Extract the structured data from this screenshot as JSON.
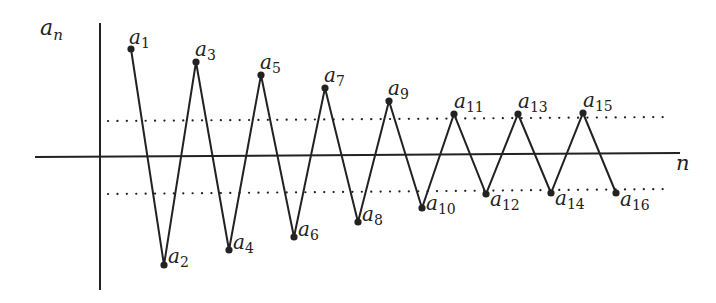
{
  "diagram": {
    "title": "",
    "y_axis_label": {
      "base": "a",
      "sub": "n"
    },
    "x_axis_label": "n",
    "colors": {
      "line": "#222222",
      "background": "#ffffff"
    },
    "axes": {
      "vertical": {
        "x": 100,
        "y1": 23,
        "y2": 290
      },
      "horizontal": {
        "x1": 35,
        "y1": 157,
        "x2": 680,
        "y2": 153
      }
    },
    "bounds": [
      {
        "name": "upper-bound",
        "style": "dotted",
        "x1": 108,
        "y1": 121,
        "x2": 668,
        "y2": 117
      },
      {
        "name": "lower-bound",
        "style": "dotted",
        "x1": 108,
        "y1": 194,
        "x2": 668,
        "y2": 189
      }
    ],
    "points": [
      {
        "label": "a",
        "sub": "1",
        "x": 131,
        "y": 49,
        "lx": 129,
        "ly": 44
      },
      {
        "label": "a",
        "sub": "2",
        "x": 164,
        "y": 265,
        "lx": 168,
        "ly": 263
      },
      {
        "label": "a",
        "sub": "3",
        "x": 196,
        "y": 62,
        "lx": 195,
        "ly": 56
      },
      {
        "label": "a",
        "sub": "4",
        "x": 229,
        "y": 250,
        "lx": 233,
        "ly": 249
      },
      {
        "label": "a",
        "sub": "5",
        "x": 261,
        "y": 75,
        "lx": 260,
        "ly": 69
      },
      {
        "label": "a",
        "sub": "6",
        "x": 294,
        "y": 237,
        "lx": 298,
        "ly": 236
      },
      {
        "label": "a",
        "sub": "7",
        "x": 325,
        "y": 88,
        "lx": 324,
        "ly": 82
      },
      {
        "label": "a",
        "sub": "8",
        "x": 358,
        "y": 222,
        "lx": 362,
        "ly": 221
      },
      {
        "label": "a",
        "sub": "9",
        "x": 389,
        "y": 101,
        "lx": 388,
        "ly": 95
      },
      {
        "label": "a",
        "sub": "10",
        "x": 422,
        "y": 208,
        "lx": 426,
        "ly": 210
      },
      {
        "label": "a",
        "sub": "11",
        "x": 454,
        "y": 114,
        "lx": 454,
        "ly": 108
      },
      {
        "label": "a",
        "sub": "12",
        "x": 486,
        "y": 194,
        "lx": 490,
        "ly": 206
      },
      {
        "label": "a",
        "sub": "13",
        "x": 518,
        "y": 114,
        "lx": 518,
        "ly": 108
      },
      {
        "label": "a",
        "sub": "14",
        "x": 551,
        "y": 193,
        "lx": 555,
        "ly": 205
      },
      {
        "label": "a",
        "sub": "15",
        "x": 583,
        "y": 113,
        "lx": 583,
        "ly": 107
      },
      {
        "label": "a",
        "sub": "16",
        "x": 616,
        "y": 193,
        "lx": 620,
        "ly": 206
      }
    ]
  }
}
